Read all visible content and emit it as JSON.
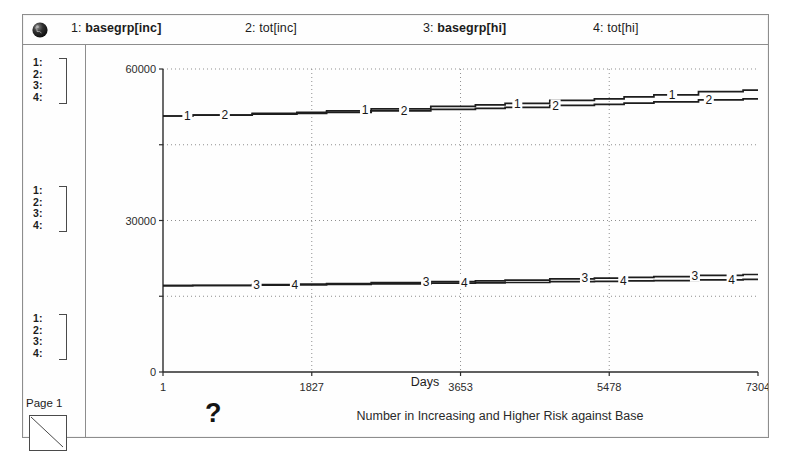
{
  "window": {
    "title": "Number in Increasing and Higher Risk against Base",
    "page_label": "Page 1",
    "help_glyph": "?",
    "globe_icon": "globe-icon",
    "page_icon": "page-triangle-icon"
  },
  "legend": {
    "items": [
      {
        "num": "1:",
        "name": "basegrp[inc]"
      },
      {
        "num": "2:",
        "name": "tot[inc]"
      },
      {
        "num": "3:",
        "name": "basegrp[hi]"
      },
      {
        "num": "4:",
        "name": "tot[hi]"
      }
    ]
  },
  "scale_groups": [
    {
      "rows": [
        "1:",
        "2:",
        "3:",
        "4:"
      ]
    },
    {
      "rows": [
        "1:",
        "2:",
        "3:",
        "4:"
      ]
    },
    {
      "rows": [
        "1:",
        "2:",
        "3:",
        "4:"
      ]
    }
  ],
  "chart_data": {
    "type": "line",
    "title": "Number in Increasing and Higher Risk against Base",
    "xlabel": "Days",
    "ylabel": "",
    "xlim": [
      1,
      7304
    ],
    "ylim": [
      0,
      60000
    ],
    "xticks": [
      1,
      1827,
      3653,
      5478,
      7304
    ],
    "xtick_labels": [
      "1",
      "1827",
      "3653",
      "5478",
      "7304"
    ],
    "yticks": [
      0,
      30000,
      60000
    ],
    "ytick_labels": [
      "0",
      "30000",
      "60000"
    ],
    "y_gridlines": [
      15000,
      30000,
      45000,
      60000
    ],
    "grid": true,
    "grid_style": "dotted",
    "legend_position": "top",
    "series": [
      {
        "name": "basegrp[inc]",
        "marker_label": "1",
        "x": [
          1,
          730,
          1461,
          1827,
          2191,
          2922,
          3653,
          4018,
          4383,
          5113,
          5478,
          5844,
          6209,
          6939,
          7304
        ],
        "values": [
          50700,
          50900,
          51200,
          51400,
          51700,
          52100,
          52600,
          52900,
          53200,
          53800,
          54100,
          54500,
          54900,
          55500,
          55800
        ]
      },
      {
        "name": "tot[inc]",
        "marker_label": "2",
        "x": [
          1,
          730,
          1461,
          1827,
          2191,
          2922,
          3653,
          4018,
          4383,
          5113,
          5478,
          5844,
          6209,
          6939,
          7304
        ],
        "values": [
          50700,
          50850,
          51050,
          51200,
          51400,
          51700,
          52000,
          52200,
          52400,
          52800,
          53000,
          53250,
          53500,
          53900,
          54100
        ]
      },
      {
        "name": "basegrp[hi]",
        "marker_label": "3",
        "x": [
          1,
          730,
          1461,
          1827,
          2191,
          2922,
          3653,
          4018,
          4383,
          5113,
          5478,
          5844,
          6209,
          6939,
          7304
        ],
        "values": [
          17100,
          17150,
          17300,
          17400,
          17500,
          17700,
          17900,
          18050,
          18200,
          18450,
          18600,
          18750,
          18900,
          19150,
          19300
        ]
      },
      {
        "name": "tot[hi]",
        "marker_label": "4",
        "x": [
          1,
          730,
          1461,
          1827,
          2191,
          2922,
          3653,
          4018,
          4383,
          5113,
          5478,
          5844,
          6209,
          6939,
          7304
        ],
        "values": [
          17100,
          17120,
          17200,
          17250,
          17320,
          17450,
          17580,
          17650,
          17730,
          17880,
          17950,
          18030,
          18100,
          18250,
          18330
        ]
      }
    ],
    "inline_series_markers": [
      {
        "label": "1",
        "x": 300,
        "y": 50700
      },
      {
        "label": "2",
        "x": 760,
        "y": 50950
      },
      {
        "label": "1",
        "x": 2480,
        "y": 51900
      },
      {
        "label": "2",
        "x": 2960,
        "y": 51750
      },
      {
        "label": "1",
        "x": 4350,
        "y": 53150
      },
      {
        "label": "2",
        "x": 4820,
        "y": 52600
      },
      {
        "label": "1",
        "x": 6250,
        "y": 54950
      },
      {
        "label": "2",
        "x": 6700,
        "y": 53800
      },
      {
        "label": "3",
        "x": 1150,
        "y": 17250
      },
      {
        "label": "4",
        "x": 1620,
        "y": 17300
      },
      {
        "label": "3",
        "x": 3230,
        "y": 17800
      },
      {
        "label": "4",
        "x": 3700,
        "y": 17600
      },
      {
        "label": "3",
        "x": 5180,
        "y": 18650
      },
      {
        "label": "4",
        "x": 5650,
        "y": 18000
      },
      {
        "label": "3",
        "x": 6530,
        "y": 19050
      },
      {
        "label": "4",
        "x": 6980,
        "y": 18270
      }
    ]
  },
  "colors": {
    "frame": "#8d8d8d",
    "axis": "#2b2b2b",
    "grid": "#8f8f8f",
    "series": "#1d1d1d",
    "background": "#fefefe"
  }
}
